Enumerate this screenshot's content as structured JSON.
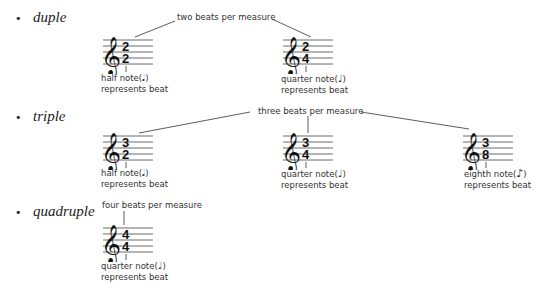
{
  "sections": [
    {
      "label": "duple",
      "beats_caption": "two beats per measure",
      "examples": [
        {
          "top": "2",
          "bottom": "2",
          "note_caption": "half note(",
          "note_glyph": "half-note",
          "note_symbol": "𝅗𝅥",
          "close": ")",
          "beat_caption": "represents beat"
        },
        {
          "top": "2",
          "bottom": "4",
          "note_caption": "quarter note(",
          "note_glyph": "quarter-note",
          "note_symbol": "♩",
          "close": ")",
          "beat_caption": "represents beat"
        }
      ]
    },
    {
      "label": "triple",
      "beats_caption": "three beats per measure",
      "examples": [
        {
          "top": "3",
          "bottom": "2",
          "note_caption": "half note(",
          "note_glyph": "half-note",
          "note_symbol": "𝅗𝅥",
          "close": ")",
          "beat_caption": "represents beat"
        },
        {
          "top": "3",
          "bottom": "4",
          "note_caption": "quarter note(",
          "note_glyph": "quarter-note",
          "note_symbol": "♩",
          "close": ")",
          "beat_caption": "represents beat"
        },
        {
          "top": "3",
          "bottom": "8",
          "note_caption": "eighth note(",
          "note_glyph": "eighth-note",
          "note_symbol": "♪",
          "close": ")",
          "beat_caption": "represents beat"
        }
      ]
    },
    {
      "label": "quadruple",
      "beats_caption": "four beats per measure",
      "examples": [
        {
          "top": "4",
          "bottom": "4",
          "note_caption": "quarter note(",
          "note_glyph": "quarter-note",
          "note_symbol": "♩",
          "close": ")",
          "beat_caption": "represents beat"
        }
      ]
    }
  ],
  "bullet": "•",
  "clef": "𝄞"
}
